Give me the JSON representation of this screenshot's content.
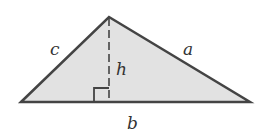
{
  "diagram": {
    "colors": {
      "fill": "#e2e2e2",
      "stroke": "#444444",
      "text": "#333333",
      "background": "#ffffff"
    },
    "vertices": {
      "left": [
        21,
        102
      ],
      "apex": [
        109,
        17
      ],
      "right": [
        250,
        102
      ]
    },
    "labels": {
      "side_c": "c",
      "side_a": "a",
      "height_h": "h",
      "base_b": "b"
    },
    "right_angle_marker": true,
    "height_line_style": "dashed"
  }
}
